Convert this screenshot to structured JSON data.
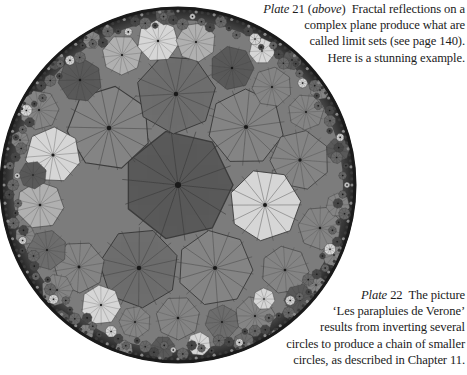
{
  "figure": {
    "colors": {
      "rim": "#2a2a2a",
      "dark_cell": "#5a5a5a",
      "mid_cell": "#858585",
      "mid_dark_cell": "#6e6e6e",
      "light_cell": "#d6d6d6",
      "pale_cell": "#b0b0b0",
      "spoke": "#3a3a3a"
    }
  },
  "caption_top": {
    "plate_word": "Plate",
    "plate_number": "21",
    "position_word": "above",
    "line1_rest": "Fractal reflections on a",
    "line2": "complex plane produce what are",
    "line3": "called limit sets (see page 140).",
    "line4": "Here is a stunning example."
  },
  "caption_bottom": {
    "plate_word": "Plate",
    "plate_number": "22",
    "line1_rest": "The picture",
    "line2": "‘Les parapluies de Verone’",
    "line3": "results from inverting several",
    "line4": "circles to produce a chain of smaller",
    "line5": "circles, as described in Chapter 11."
  }
}
